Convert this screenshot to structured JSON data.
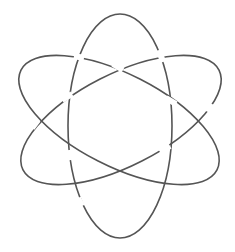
{
  "diagram": {
    "title": "",
    "stroke_color": "#555555",
    "background": "#ffffff",
    "components": [
      {
        "name": "vertical-ellipse",
        "cx": 120,
        "cy": 126,
        "rx": 52,
        "ry": 112,
        "rotate": 0
      },
      {
        "name": "ellipse-tilted-down-right",
        "cx": 119,
        "cy": 120,
        "rx": 110,
        "ry": 46,
        "rotate": 27
      },
      {
        "name": "ellipse-tilted-up-right",
        "cx": 121,
        "cy": 120,
        "rx": 110,
        "ry": 46,
        "rotate": -27
      }
    ]
  }
}
